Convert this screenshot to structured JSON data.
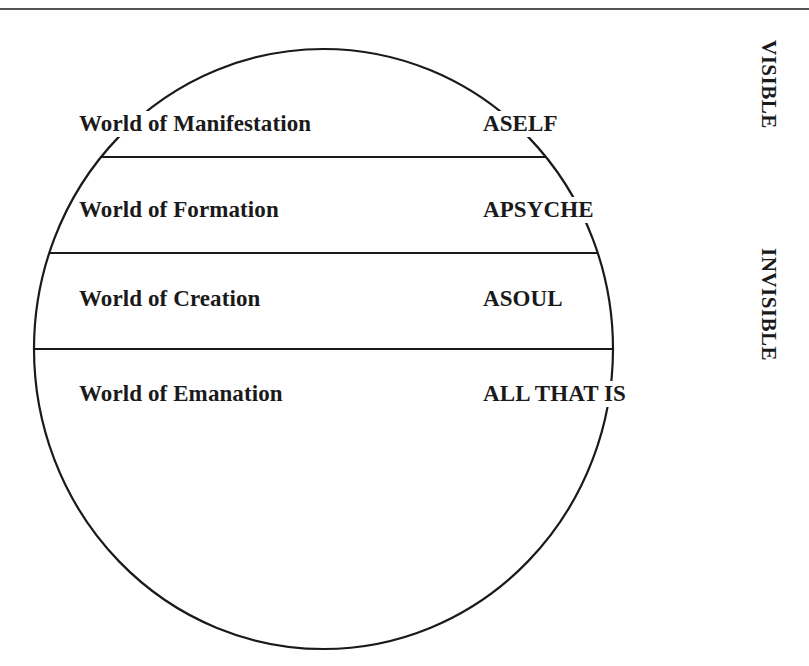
{
  "diagram": {
    "colors": {
      "stroke": "#1a1a1a",
      "text": "#1a1a1a",
      "top_rule": "#555555",
      "background": "#ffffff"
    },
    "rows": [
      {
        "world": "World of Manifestation",
        "aspect": "ASELF"
      },
      {
        "world": "World of Formation",
        "aspect": "APSYCHE"
      },
      {
        "world": "World of Creation",
        "aspect": "ASOUL"
      },
      {
        "world": "World of Emanation",
        "aspect": "ALL THAT IS"
      }
    ],
    "side_labels": {
      "visible": "VISIBLE",
      "invisible": "INVISIBLE"
    }
  }
}
